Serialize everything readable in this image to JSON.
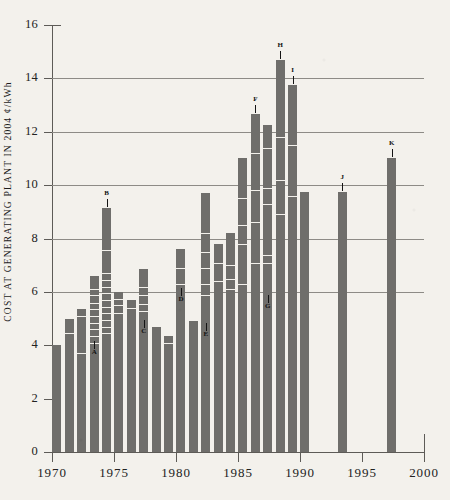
{
  "chart_data": {
    "type": "bar",
    "title": "",
    "subtitle": "",
    "xlabel": "",
    "ylabel": "COST AT GENERATING PLANT IN 2004 ¢/kWh",
    "xlim": [
      1970,
      2000
    ],
    "ylim": [
      0,
      16
    ],
    "ytick_step": 2,
    "yticks": [
      0,
      2,
      4,
      6,
      8,
      10,
      12,
      14,
      16
    ],
    "ytick_labels": [
      "0",
      "2",
      "4",
      "6",
      "8",
      "10",
      "12",
      "14",
      "16"
    ],
    "xticks": [
      1970,
      1975,
      1980,
      1985,
      1990,
      1995,
      2000
    ],
    "xtick_labels": [
      "1970",
      "1975",
      "1980",
      "1985",
      "1990",
      "1995",
      "2000"
    ],
    "gridlines_y": [
      6,
      8,
      10,
      12,
      14
    ],
    "grid": true,
    "legend": "none",
    "bar_color": "#6f6e6b",
    "background_color": "#f3f1ec",
    "axis_color": "#5d5b57",
    "grid_color": "#8d8b86",
    "x": [
      1970,
      1971,
      1972,
      1973,
      1974,
      1975,
      1976,
      1977,
      1978,
      1979,
      1980,
      1981,
      1982,
      1983,
      1984,
      1985,
      1986,
      1987,
      1988,
      1989,
      1990,
      1993,
      1997
    ],
    "values": [
      4.0,
      5.0,
      5.35,
      6.6,
      9.15,
      6.0,
      5.7,
      6.85,
      4.7,
      4.35,
      7.6,
      4.9,
      9.7,
      7.8,
      8.2,
      11.0,
      12.65,
      12.25,
      14.7,
      13.75,
      9.75,
      11.0,
      0
    ],
    "bars": [
      {
        "year": 1970,
        "value": 4.0,
        "segments": []
      },
      {
        "year": 1971,
        "value": 5.0,
        "segments": [
          4.45
        ]
      },
      {
        "year": 1972,
        "value": 5.35,
        "segments": [
          5.1,
          3.7
        ]
      },
      {
        "year": 1973,
        "value": 6.6,
        "segments": [
          6.1,
          5.9,
          5.6,
          5.35,
          5.1,
          4.85,
          4.6,
          4.35,
          4.1
        ]
      },
      {
        "year": 1974,
        "value": 9.15,
        "segments": [
          7.55,
          6.7,
          6.45,
          6.2,
          5.95,
          5.7,
          5.45,
          5.2,
          4.95,
          4.7,
          4.45
        ]
      },
      {
        "year": 1975,
        "value": 6.0,
        "segments": [
          5.75,
          5.5,
          5.2
        ]
      },
      {
        "year": 1976,
        "value": 5.7,
        "segments": [
          5.4
        ]
      },
      {
        "year": 1977,
        "value": 6.85,
        "segments": [
          6.2,
          5.9,
          5.55,
          5.3
        ]
      },
      {
        "year": 1978,
        "value": 4.7,
        "segments": []
      },
      {
        "year": 1979,
        "value": 4.35,
        "segments": [
          4.1
        ]
      },
      {
        "year": 1980,
        "value": 7.6,
        "segments": [
          6.9,
          6.3
        ]
      },
      {
        "year": 1981,
        "value": 4.9,
        "segments": []
      },
      {
        "year": 1982,
        "value": 9.7,
        "segments": [
          8.2,
          7.5,
          6.9,
          6.3,
          5.9
        ]
      },
      {
        "year": 1983,
        "value": 7.8,
        "segments": [
          7.1,
          6.4
        ]
      },
      {
        "year": 1984,
        "value": 8.2,
        "segments": [
          7.0,
          6.5,
          6.1
        ]
      },
      {
        "year": 1985,
        "value": 11.0,
        "segments": [
          9.5,
          8.5,
          7.8,
          6.3
        ]
      },
      {
        "year": 1986,
        "value": 12.65,
        "segments": [
          11.2,
          9.8,
          8.6,
          7.1
        ]
      },
      {
        "year": 1987,
        "value": 12.25,
        "segments": [
          11.4,
          9.9,
          9.3,
          7.4,
          7.1
        ]
      },
      {
        "year": 1988,
        "value": 14.7,
        "segments": [
          11.8,
          10.2,
          8.9
        ]
      },
      {
        "year": 1989,
        "value": 13.75,
        "segments": [
          11.5,
          9.6
        ]
      },
      {
        "year": 1990,
        "value": 9.75,
        "segments": []
      },
      {
        "year": 1993,
        "value": 9.75,
        "segments": []
      },
      {
        "year": 1997,
        "value": 11.0,
        "segments": []
      }
    ],
    "callouts": [
      {
        "label": "A",
        "year": 1973,
        "value": 4.15,
        "above": false
      },
      {
        "label": "B",
        "year": 1974,
        "value": 9.15,
        "above": true
      },
      {
        "label": "C",
        "year": 1977,
        "value": 4.95,
        "above": false
      },
      {
        "label": "D",
        "year": 1980,
        "value": 6.15,
        "above": false
      },
      {
        "label": "E",
        "year": 1982,
        "value": 4.85,
        "above": false
      },
      {
        "label": "F",
        "year": 1986,
        "value": 12.65,
        "above": true
      },
      {
        "label": "G",
        "year": 1987,
        "value": 5.9,
        "above": false
      },
      {
        "label": "H",
        "year": 1988,
        "value": 14.7,
        "above": true
      },
      {
        "label": "I",
        "year": 1989,
        "value": 13.75,
        "above": true
      },
      {
        "label": "J",
        "year": 1993,
        "value": 9.75,
        "above": true
      },
      {
        "label": "K",
        "year": 1997,
        "value": 11.0,
        "above": true
      }
    ]
  }
}
